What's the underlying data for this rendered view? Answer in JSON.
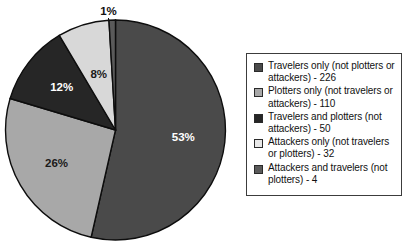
{
  "chart_data": {
    "type": "pie",
    "title": "",
    "subtitle": "",
    "xlabel": "",
    "ylabel": "",
    "legend_position": "right",
    "grid": false,
    "total": 422,
    "categories": [
      "Travelers only (not plotters or attackers)",
      "Plotters only (not travelers or attackers)",
      "Travelers and plotters (not attackers)",
      "Attackers only (not travelers or plotters)",
      "Attackers and travelers (not plotters)"
    ],
    "values": [
      226,
      110,
      50,
      32,
      4
    ],
    "percent_labels": [
      "53%",
      "26%",
      "12%",
      "8%",
      "1%"
    ],
    "percents": [
      53,
      26,
      12,
      8,
      1
    ],
    "colors": [
      "#4a4a4a",
      "#a8a8a8",
      "#262626",
      "#d8d8d8",
      "#5a5a5a"
    ],
    "label_colors": [
      "#ffffff",
      "#1a1a1a",
      "#ffffff",
      "#1a1a1a",
      "#1a1a1a"
    ],
    "start_angle_deg": 0,
    "direction": "clockwise"
  },
  "pie": {
    "slices": [
      {
        "percent_label": "53%"
      },
      {
        "percent_label": "26%"
      },
      {
        "percent_label": "12%"
      },
      {
        "percent_label": "8%"
      },
      {
        "percent_label": "1%"
      }
    ]
  },
  "legend": {
    "items": [
      {
        "label": "Travelers only (not plotters or attackers) - 226",
        "color": "#4a4a4a"
      },
      {
        "label": "Plotters only (not travelers or attackers) - 110",
        "color": "#a8a8a8"
      },
      {
        "label": "Travelers and plotters (not attackers) - 50",
        "color": "#262626"
      },
      {
        "label": "Attackers only (not travelers or plotters) - 32",
        "color": "#e8e8e8"
      },
      {
        "label": "Attackers and travelers (not plotters) - 4",
        "color": "#5a5a5a"
      }
    ]
  }
}
